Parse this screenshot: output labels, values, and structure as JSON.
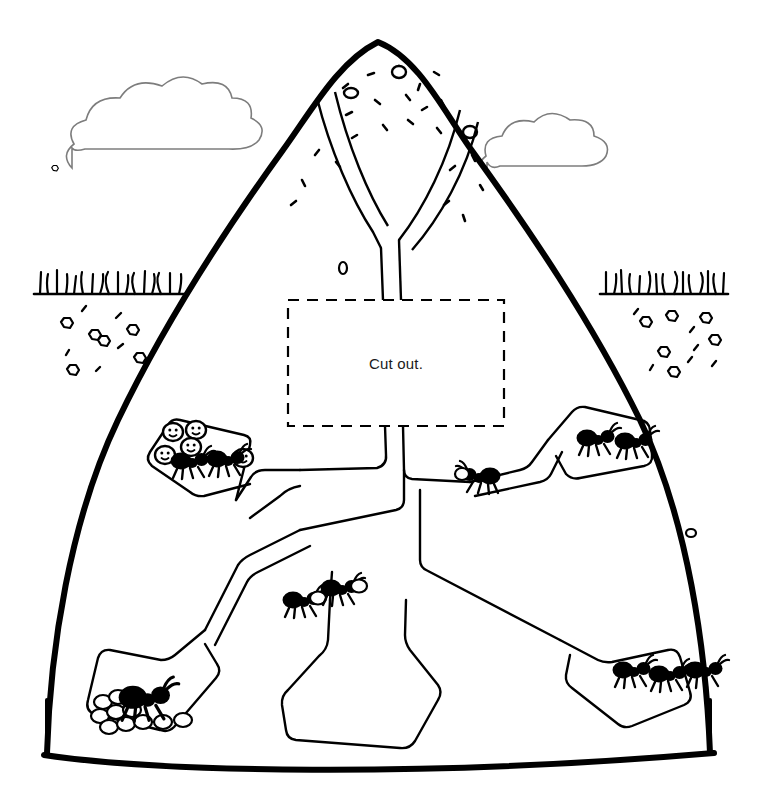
{
  "worksheet": {
    "type": "ant-hill-cross-section-cutout",
    "cutout_box": {
      "label": "Cut out.",
      "border_style": "dashed",
      "x": 288,
      "y": 300,
      "width": 216,
      "height": 126
    }
  },
  "colors": {
    "ink": "#000000",
    "cloud_line": "#808080",
    "paper": "#ffffff",
    "ant_body": "#000000",
    "egg_fill": "#ffffff"
  },
  "sky": {
    "clouds": [
      {
        "name": "cloud-left",
        "x": 68,
        "y": 100,
        "width": 175,
        "height": 72
      },
      {
        "name": "cloud-right",
        "x": 480,
        "y": 112,
        "width": 130,
        "height": 68
      }
    ]
  },
  "ground": {
    "left_patch": {
      "name": "grass-left",
      "x": 34,
      "y": 268,
      "width": 158,
      "blades": 17
    },
    "right_patch": {
      "name": "grass-right",
      "x": 598,
      "y": 268,
      "width": 130,
      "blades": 17
    },
    "soil_pebbles_left": 11,
    "soil_pebbles_right": 13
  },
  "hill": {
    "name": "ant-hill",
    "summit_debris_count": 22,
    "entrances": 2
  },
  "chambers": [
    {
      "name": "chamber-upper-left",
      "ants": 2,
      "eggs": 5,
      "description": "nursery chamber with ants tending larvae"
    },
    {
      "name": "chamber-upper-right",
      "ants": 2,
      "eggs": 0,
      "description": "upper right chamber with two ants"
    },
    {
      "name": "tunnel-mid-right",
      "ants": 1,
      "eggs": 1,
      "description": "ant carrying an egg in sloped tunnel"
    },
    {
      "name": "tunnel-mid-left",
      "ants": 2,
      "eggs": 2,
      "description": "two ants carrying eggs up the tunnel"
    },
    {
      "name": "chamber-lower-left",
      "ants": 1,
      "eggs": 10,
      "description": "queen chamber with egg pile"
    },
    {
      "name": "chamber-lower-right",
      "ants": 3,
      "eggs": 0,
      "description": "lower right chamber with three ants"
    },
    {
      "name": "chamber-bottom-center",
      "ants": 0,
      "eggs": 0,
      "description": "empty bottom chamber"
    }
  ],
  "totals": {
    "ants": 11,
    "eggs": 18,
    "chambers": 7
  }
}
